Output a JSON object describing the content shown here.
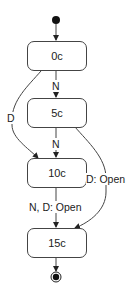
{
  "diagram": {
    "type": "state-machine",
    "colors": {
      "stroke": "#444444",
      "text": "#222222",
      "background": "#ffffff"
    },
    "initial_state": {
      "icon": "initial-node-dot"
    },
    "final_state": {
      "icon": "final-node-bullseye"
    },
    "states": [
      {
        "id": "s0",
        "label": "0c"
      },
      {
        "id": "s5",
        "label": "5c"
      },
      {
        "id": "s10",
        "label": "10c"
      },
      {
        "id": "s15",
        "label": "15c"
      }
    ],
    "transitions": [
      {
        "from": "initial",
        "to": "0c",
        "label": ""
      },
      {
        "from": "0c",
        "to": "5c",
        "label": "N"
      },
      {
        "from": "0c",
        "to": "10c",
        "label": "D"
      },
      {
        "from": "5c",
        "to": "10c",
        "label": "N"
      },
      {
        "from": "5c",
        "to": "15c",
        "label": "D: Open"
      },
      {
        "from": "10c",
        "to": "15c",
        "label": "N, D: Open"
      },
      {
        "from": "15c",
        "to": "final",
        "label": ""
      }
    ]
  }
}
